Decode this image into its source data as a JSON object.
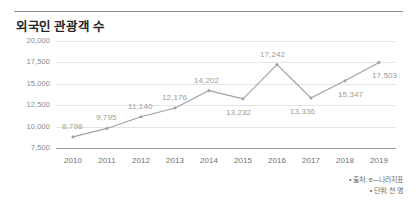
{
  "chart_data": {
    "type": "line",
    "title": "외국인 관광객 수",
    "xlabel": "",
    "ylabel": "",
    "categories": [
      "2010",
      "2011",
      "2012",
      "2013",
      "2014",
      "2015",
      "2016",
      "2017",
      "2018",
      "2019"
    ],
    "values": [
      8798,
      9795,
      11140,
      12176,
      14202,
      13232,
      17242,
      13336,
      15347,
      17503
    ],
    "point_labels": [
      "8,798",
      "9,795",
      "11,140",
      "12,176",
      "14,202",
      "13,232",
      "17,242",
      "13,336",
      "15,347",
      "17,503"
    ],
    "ylim": [
      7500,
      20000
    ],
    "ytick_labels": [
      "20,000",
      "17,500",
      "15,000",
      "12,500",
      "10,000",
      "7,500"
    ],
    "ytick_values": [
      20000,
      17500,
      15000,
      12500,
      10000,
      7500
    ],
    "grid": true,
    "legend": "none",
    "series_color": "#a0a0a0",
    "marker": "diamond",
    "annotations": [
      "• 출처: e—나라지표",
      "• 단위: 천 명"
    ]
  },
  "footnotes": {
    "source": "• 출처: e—나라지표",
    "unit": "• 단위: 천 명"
  },
  "colors": {
    "line": "#a0a0a0",
    "grid": "#e4e4e4",
    "axis": "#9a9a9a",
    "title": "#262626",
    "tick": "#8a8a8a",
    "label": "#9b9b9b"
  }
}
